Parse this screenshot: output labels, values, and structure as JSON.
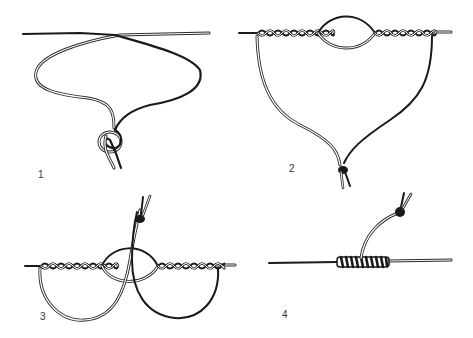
{
  "figure": {
    "colors": {
      "dark_line": "#1a1a1a",
      "light_line_outline": "#2a2a2a",
      "background": "#ffffff"
    },
    "panels": [
      {
        "label": "1",
        "caption": "Step 1: lines overlapped, light line loop tied in an overhand knot with the dark line"
      },
      {
        "label": "2",
        "caption": "Step 2: lines twisted together on both sides, central loop opened, tag ends knotted below"
      },
      {
        "label": "3",
        "caption": "Step 3: tag ends passed through the central opening in opposite directions"
      },
      {
        "label": "4",
        "caption": "Step 4: knot tightened into a barrel of wraps, tag ends drawn upward"
      }
    ]
  }
}
